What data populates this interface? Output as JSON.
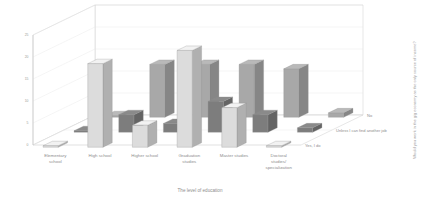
{
  "chart_data": {
    "type": "bar",
    "title": "",
    "subtitle": "",
    "xlabel": "The level of education",
    "ylabel": "",
    "zlabel": "Would you work in the gig economy as the only source of income?",
    "ylim": [
      0,
      25
    ],
    "yticks": [
      "0",
      "5",
      "10",
      "15",
      "20",
      "25"
    ],
    "grid": true,
    "legend_position": "depth-axis-right",
    "projection": "3d",
    "categories": [
      "Elementary school",
      "High school",
      "Higher school",
      "Graduation studies",
      "Master studies",
      "Doctoral studies/ specialization"
    ],
    "series": [
      {
        "name": "Yes, I do",
        "color": "#dcdcdc",
        "values": [
          0,
          19,
          5,
          22,
          9,
          0
        ]
      },
      {
        "name": "Unless I can find another job",
        "color": "#7d7d7d",
        "values": [
          0,
          4,
          2,
          7,
          4,
          1
        ]
      },
      {
        "name": "No",
        "color": "#a8a8a8",
        "values": [
          0,
          12,
          12,
          12,
          11,
          1
        ]
      }
    ]
  },
  "axes": {
    "x_title": "The level of education",
    "z_title": "Would you work in the gig economy as the only source of income?"
  },
  "categories": [
    {
      "line1": "Elementary",
      "line2": "school",
      "line3": ""
    },
    {
      "line1": "High school",
      "line2": "",
      "line3": ""
    },
    {
      "line1": "Higher school",
      "line2": "",
      "line3": ""
    },
    {
      "line1": "Graduation",
      "line2": "studies",
      "line3": ""
    },
    {
      "line1": "Master studies",
      "line2": "",
      "line3": ""
    },
    {
      "line1": "Doctoral",
      "line2": "studies/",
      "line3": "specialization"
    }
  ],
  "series_labels": [
    {
      "name": "No"
    },
    {
      "name": "Unless I can find another job"
    },
    {
      "name": "Yes, I do"
    }
  ],
  "yticks": [
    {
      "label": "25"
    },
    {
      "label": "20"
    },
    {
      "label": "15"
    },
    {
      "label": "10"
    },
    {
      "label": "5"
    },
    {
      "label": "0"
    }
  ],
  "colors": {
    "series_front": "#dcdcdc",
    "series_middle": "#7d7d7d",
    "series_back": "#a8a8a8",
    "grid": "#e6e6e6",
    "axis": "#b4b4b4",
    "text": "#8d8d8d",
    "background": "#ffffff"
  }
}
